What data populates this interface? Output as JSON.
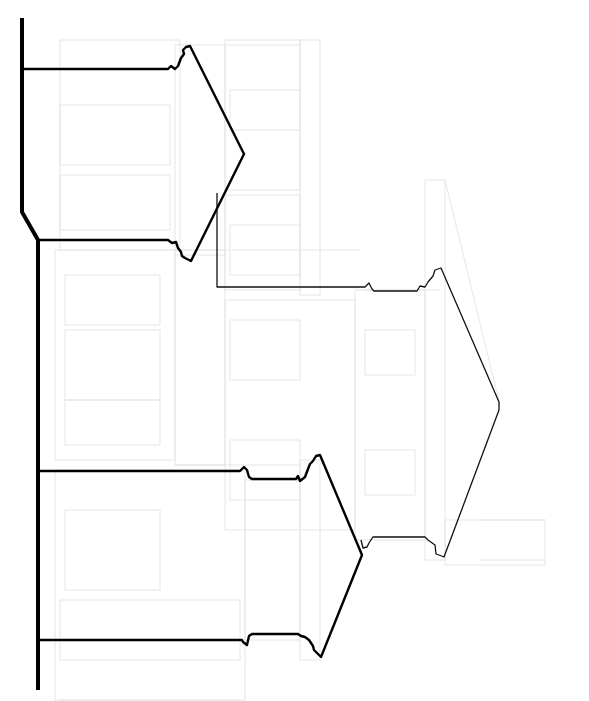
{
  "drawing": {
    "title": "",
    "description": "Rotated architectural elevation outline of a building with three pedimented porticos",
    "colors": {
      "background": "#ffffff",
      "outline": "#000000",
      "ghost_lines": "#e6e6e6"
    },
    "ground_line": "22,18 22,212 38,240 38,690",
    "upper_pediment": "22,69 168,69 171,66 175,69 178,66 181,58 184,54 183,50 186,47 190,46 244,154 191,261 185,258 182,256 181,252 178,248 176,242 172,243 168,240 38,240",
    "middle_pediment": "217,193 217,287 365,287 369,283 372,289 374,291 417,291 420,286 425,287 428,282 433,276 435,270 441,268 499,402 499,410 444,557 439,555 436,554 435,545 428,540 425,537 420,537 373,537 371,540 369,543 367,547 363,548 361,540",
    "lower_pediment": "38,471 240,471 244,467 247,470 249,477 252,479 296,479 298,476 300,481 305,477 308,469 310,464 313,461 316,456 320,455 362,555 321,657 317,653 314,650 313,646 309,640 305,637 301,636 298,634 252,634 249,636 247,645 243,642 242,640 38,640",
    "ghost_rects": [
      [
        60,
        40,
        120,
        210
      ],
      [
        60,
        105,
        110,
        60
      ],
      [
        60,
        175,
        110,
        55
      ],
      [
        175,
        45,
        50,
        210
      ],
      [
        225,
        40,
        75,
        150
      ],
      [
        230,
        90,
        70,
        40
      ],
      [
        225,
        195,
        75,
        95
      ],
      [
        230,
        225,
        70,
        50
      ],
      [
        300,
        40,
        20,
        255
      ],
      [
        55,
        250,
        120,
        210
      ],
      [
        65,
        275,
        95,
        50
      ],
      [
        65,
        330,
        95,
        70
      ],
      [
        65,
        400,
        95,
        45
      ],
      [
        175,
        250,
        50,
        215
      ],
      [
        225,
        300,
        130,
        230
      ],
      [
        230,
        320,
        70,
        60
      ],
      [
        230,
        440,
        70,
        60
      ],
      [
        355,
        290,
        70,
        250
      ],
      [
        365,
        330,
        50,
        45
      ],
      [
        365,
        450,
        50,
        45
      ],
      [
        425,
        180,
        20,
        380
      ],
      [
        55,
        470,
        190,
        230
      ],
      [
        65,
        510,
        95,
        80
      ],
      [
        245,
        480,
        55,
        160
      ],
      [
        300,
        460,
        20,
        200
      ],
      [
        445,
        520,
        100,
        45
      ],
      [
        60,
        600,
        180,
        60
      ]
    ],
    "ghost_lines": [
      [
        445,
        180,
        500,
        405
      ],
      [
        225,
        45,
        300,
        45
      ],
      [
        60,
        700,
        240,
        700
      ],
      [
        365,
        290,
        440,
        290
      ],
      [
        480,
        520,
        545,
        520
      ],
      [
        480,
        560,
        545,
        560
      ],
      [
        180,
        250,
        360,
        250
      ],
      [
        175,
        465,
        300,
        465
      ]
    ]
  }
}
